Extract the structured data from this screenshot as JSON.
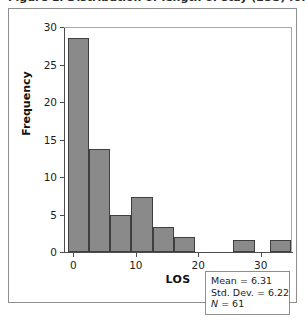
{
  "caption": {
    "text": "Figure 1. Distribution of length of stay (LOS) for patients."
  },
  "chart_data": {
    "type": "bar",
    "title": "",
    "subtitle": "",
    "xlabel": "LOS",
    "ylabel": "Frequency",
    "xlim": [
      -1.5,
      35
    ],
    "ylim": [
      0,
      30
    ],
    "grid": false,
    "legend": null,
    "bar_color": "#8a8a8a",
    "bar_border_color": "#3f3f3f",
    "x_ticks": [
      0,
      10,
      20,
      30
    ],
    "x_tick_labels": [
      "0",
      "10",
      "20",
      "30"
    ],
    "y_ticks": [
      0,
      5,
      10,
      15,
      20,
      25,
      30
    ],
    "y_tick_labels": [
      "0",
      "5",
      "10",
      "15",
      "20",
      "25",
      "30"
    ],
    "bin_width": 3.4,
    "bins": [
      {
        "label": "0.0-3.4",
        "x_start": -0.9,
        "x_end": 2.5,
        "value": 28.5
      },
      {
        "label": "3.4-6.8",
        "x_start": 2.5,
        "x_end": 5.9,
        "value": 13.8
      },
      {
        "label": "6.8-10.2",
        "x_start": 5.9,
        "x_end": 9.3,
        "value": 5.0
      },
      {
        "label": "10.2-13.6",
        "x_start": 9.3,
        "x_end": 12.7,
        "value": 7.3
      },
      {
        "label": "13.6-17.0",
        "x_start": 12.7,
        "x_end": 16.1,
        "value": 3.4
      },
      {
        "label": "17.0-20.4",
        "x_start": 16.1,
        "x_end": 19.5,
        "value": 2.0
      },
      {
        "label": "27.2-30.6",
        "x_start": 25.6,
        "x_end": 29.0,
        "value": 1.6
      },
      {
        "label": "32.3-35.7",
        "x_start": 31.4,
        "x_end": 34.8,
        "value": 1.6
      }
    ],
    "categories": [
      "0.0-3.4",
      "3.4-6.8",
      "6.8-10.2",
      "10.2-13.6",
      "13.6-17.0",
      "17.0-20.4",
      "27.2-30.6",
      "32.3-35.7"
    ],
    "values": [
      28.5,
      13.8,
      5.0,
      7.3,
      3.4,
      2.0,
      1.6,
      1.6
    ]
  },
  "stats_box": {
    "mean_line": "Mean = 6.31",
    "stddev_line": "Std. Dev. = 6.22",
    "n_symbol": "N",
    "n_value": " = 61"
  }
}
